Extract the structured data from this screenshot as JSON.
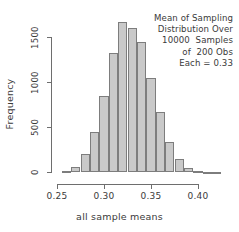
{
  "chart_data": {
    "type": "bar",
    "title": "",
    "xlabel": "all sample means",
    "ylabel": "Frequency",
    "grid": false,
    "legend": null,
    "xlim": [
      0.2383,
      0.4404
    ],
    "ylim": [
      0,
      1670
    ],
    "xticks": [
      0.25,
      0.3,
      0.35,
      0.4
    ],
    "xticklabels": [
      "0.25",
      "0.30",
      "0.35",
      "0.40"
    ],
    "yticks": [
      0,
      500,
      1000,
      1500
    ],
    "yticklabels": [
      "0",
      "500",
      "1000",
      "1500"
    ],
    "bin_width": 0.01,
    "bin_starts": [
      0.255,
      0.265,
      0.275,
      0.285,
      0.295,
      0.305,
      0.315,
      0.325,
      0.335,
      0.345,
      0.355,
      0.365,
      0.375,
      0.385,
      0.395,
      0.405,
      0.415
    ],
    "categories": [
      "0.255-0.265",
      "0.265-0.275",
      "0.275-0.285",
      "0.285-0.295",
      "0.295-0.305",
      "0.305-0.315",
      "0.315-0.325",
      "0.325-0.335",
      "0.335-0.345",
      "0.345-0.355",
      "0.355-0.365",
      "0.365-0.375",
      "0.375-0.385",
      "0.385-0.395",
      "0.395-0.405",
      "0.405-0.415",
      "0.415-0.425"
    ],
    "values": [
      10,
      55,
      200,
      440,
      840,
      1320,
      1670,
      1600,
      1450,
      1040,
      670,
      330,
      145,
      50,
      15,
      5,
      2
    ],
    "bar_fill_color": "#c9c9c9",
    "bar_edge_color": "#7d7d7d",
    "axis_color": "#6e6e6e",
    "text_color": "#3a3a3a",
    "background_color": "#ffffff",
    "annotation_lines": [
      "Mean of Sampling",
      "Distribution Over",
      "10000  Samples",
      "of  200 Obs",
      "Each = 0.33"
    ]
  },
  "annotation": {
    "line1": "Mean of Sampling",
    "line2": "Distribution Over",
    "line3": "10000  Samples",
    "line4": "of  200 Obs",
    "line5": "Each = 0.33"
  },
  "axes": {
    "x_title": "all sample means",
    "y_title": "Frequency",
    "x_labels": [
      "0.25",
      "0.30",
      "0.35",
      "0.40"
    ],
    "y_labels": [
      "0",
      "500",
      "1000",
      "1500"
    ]
  }
}
